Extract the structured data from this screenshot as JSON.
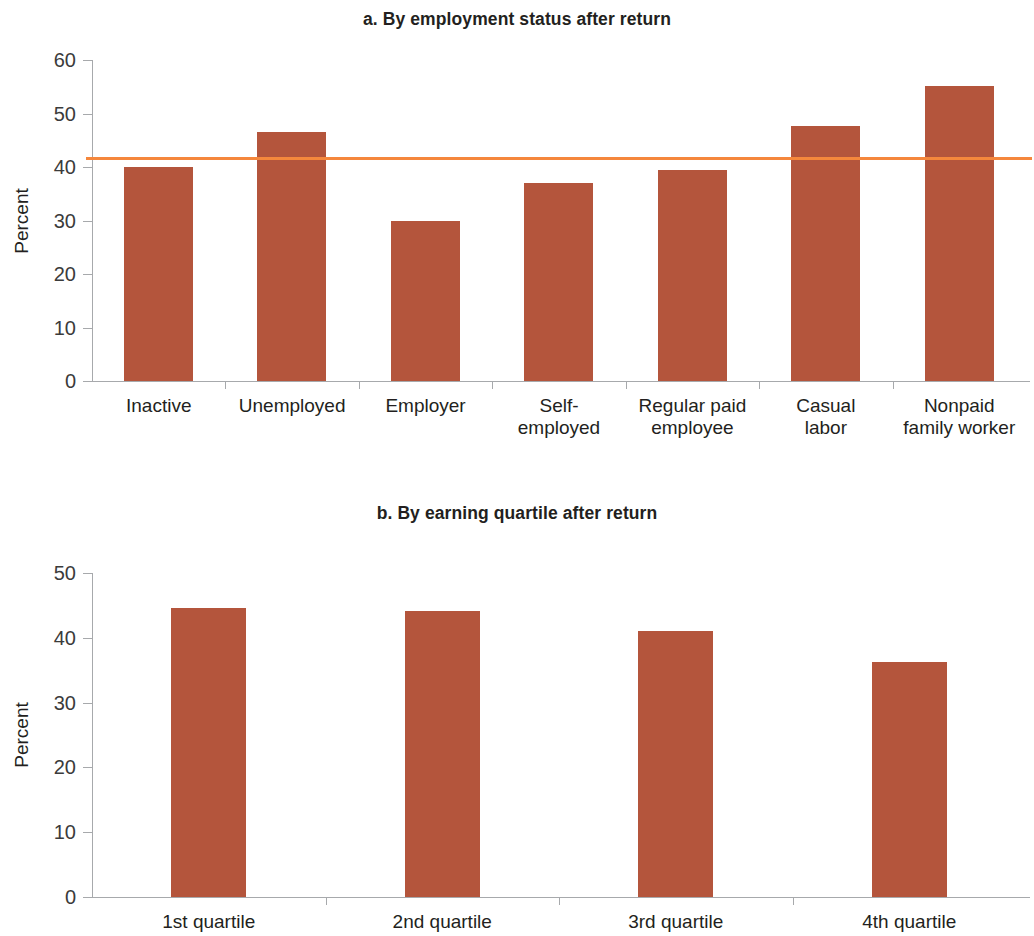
{
  "figure": {
    "background_color": "#ffffff",
    "bar_color": "#b4553c",
    "reference_line_color": "#f5873c",
    "axis_color": "#a7a9ac",
    "text_color": "#231f20"
  },
  "panel_a": {
    "title": "a. By employment status after return",
    "ylabel": "Percent",
    "ytick_labels": [
      "0",
      "10",
      "20",
      "30",
      "40",
      "50",
      "60"
    ],
    "xtick_labels": [
      "Inactive",
      "Unemployed",
      "Employer",
      "Self-\nemployed",
      "Regular paid\nemployee",
      "Casual\nlabor",
      "Nonpaid\nfamily worker"
    ]
  },
  "panel_b": {
    "title": "b. By earning quartile after return",
    "ylabel": "Percent",
    "ytick_labels": [
      "0",
      "10",
      "20",
      "30",
      "40",
      "50"
    ],
    "xtick_labels": [
      "1st quartile",
      "2nd quartile",
      "3rd quartile",
      "4th quartile"
    ]
  },
  "chart_data": [
    {
      "panel": "a",
      "type": "bar",
      "title": "a. By employment status after return",
      "xlabel": "",
      "ylabel": "Percent",
      "ylim": [
        0,
        60
      ],
      "ytick_values": [
        0,
        10,
        20,
        30,
        40,
        50,
        60
      ],
      "grid": false,
      "legend": "none",
      "categories": [
        "Inactive",
        "Unemployed",
        "Employer",
        "Self-employed",
        "Regular paid employee",
        "Casual labor",
        "Nonpaid family worker"
      ],
      "values": [
        40.0,
        46.5,
        29.9,
        37.0,
        39.4,
        47.6,
        55.1
      ],
      "annotations": [
        {
          "type": "horizontal_reference_line",
          "value": 41.9,
          "color": "#f5873c",
          "label": ""
        }
      ]
    },
    {
      "panel": "b",
      "type": "bar",
      "title": "b. By earning quartile after return",
      "xlabel": "",
      "ylabel": "Percent",
      "ylim": [
        0,
        50
      ],
      "ytick_values": [
        0,
        10,
        20,
        30,
        40,
        50
      ],
      "grid": false,
      "legend": "none",
      "categories": [
        "1st quartile",
        "2nd quartile",
        "3rd quartile",
        "4th quartile"
      ],
      "values": [
        44.6,
        44.2,
        41.0,
        36.3
      ]
    }
  ]
}
